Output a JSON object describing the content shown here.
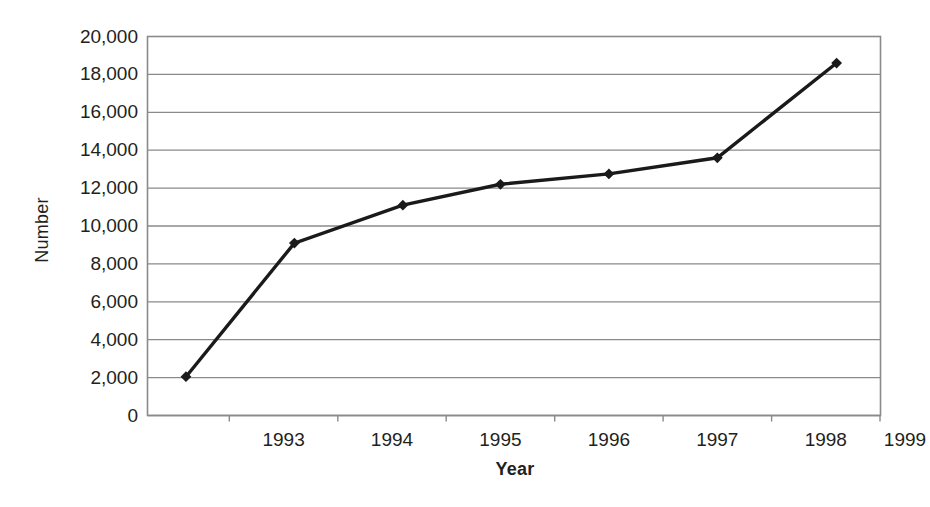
{
  "chart_data": {
    "type": "line",
    "title": "",
    "subtitle": "",
    "xlabel": "Year",
    "ylabel": "Number",
    "xlim": [
      1992.25,
      1999.0
    ],
    "ylim": [
      0,
      20000
    ],
    "grid": true,
    "gridlines": "horizontal",
    "legend": null,
    "legend_position": "none",
    "marker": "diamond",
    "line_color": "#1a1a1a",
    "marker_color": "#1a1a1a",
    "axis_color": "#808080",
    "x": [
      1992.6,
      1993.6,
      1994.6,
      1995.5,
      1996.5,
      1997.5,
      1998.6
    ],
    "values": [
      2050,
      9100,
      11100,
      12200,
      12750,
      13600,
      18600
    ],
    "points": [
      {
        "x": 1992.6,
        "y": 2050
      },
      {
        "x": 1993.6,
        "y": 9100
      },
      {
        "x": 1994.6,
        "y": 11100
      },
      {
        "x": 1995.5,
        "y": 12200
      },
      {
        "x": 1996.5,
        "y": 12750
      },
      {
        "x": 1997.5,
        "y": 13600
      },
      {
        "x": 1998.6,
        "y": 18600
      }
    ],
    "y_ticks": [
      0,
      2000,
      4000,
      6000,
      8000,
      10000,
      12000,
      14000,
      16000,
      18000,
      20000
    ],
    "y_tick_labels": [
      "0",
      "2,000",
      "4,000",
      "6,000",
      "8,000",
      "10,000",
      "12,000",
      "14,000",
      "16,000",
      "18,000",
      "20,000"
    ],
    "x_ticks": [
      1993,
      1994,
      1995,
      1996,
      1997,
      1998,
      1999
    ],
    "x_tick_labels": [
      "1993",
      "1994",
      "1995",
      "1996",
      "1997",
      "1998",
      "1999"
    ]
  }
}
